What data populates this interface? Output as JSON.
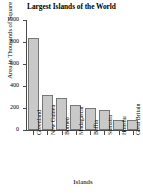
{
  "chart_data": {
    "type": "bar",
    "title": "Largest Islands of the World",
    "xlabel": "Islands",
    "ylabel": "Area in Thousands of Square Miles",
    "categories": [
      "Greenland",
      "New Guinea",
      "Borneo",
      "Madagascar",
      "Baffin",
      "Sumatra",
      "Honshu",
      "Great Britain"
    ],
    "values": [
      840,
      320,
      290,
      230,
      200,
      180,
      90,
      88
    ],
    "ylim": [
      0,
      1000
    ],
    "yticks": [
      0,
      200,
      400,
      600,
      800,
      1000
    ],
    "ytick_labels": [
      "0",
      "200",
      "400",
      "600",
      "800",
      "1000"
    ],
    "grid": false,
    "legend": null,
    "bar_fill_color": "#c9c9c9",
    "bar_border_color": "#777777",
    "axis_color": "#4a4a4a"
  }
}
